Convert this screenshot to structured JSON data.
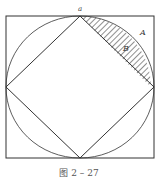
{
  "figure": {
    "vertex_label": "a",
    "region_labels": {
      "outer": "A",
      "segment": "B"
    },
    "caption": "图 2 – 27",
    "colors": {
      "stroke": "#333333",
      "hatch": "#333333",
      "background": "#ffffff"
    }
  }
}
